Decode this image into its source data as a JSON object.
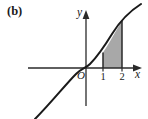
{
  "figure": {
    "panel_label": "(b)",
    "background_color": "#ffffff",
    "ink_color": "#1a1a1a",
    "shade_color": "#a8a8a8",
    "axes": {
      "x_axis_label": "x",
      "y_axis_label": "y",
      "origin_label": "O",
      "x_tick_labels": [
        "1",
        "2"
      ],
      "y_tick_labels": [],
      "x_arrow": "arrow-right",
      "y_arrow": "arrow-up"
    },
    "curve": {
      "description": "increasing cubic-like curve through the origin",
      "path": "M 35 119 C 50 104, 66 84, 76 74 C 82 68, 86 68, 90 64 C 98 56, 104 47, 112 34 C 120 21, 130 11, 141 4"
    },
    "shaded_region": {
      "label": "area under curve between x = 1 and x = 2",
      "x_from": "1",
      "x_to": "2",
      "path": "M 103 68 L 103 52.6 C 107 46.4, 110 41.5, 113.5 35.2 C 117 29.1, 119.5 24.6, 122 20.4 L 122 68 Z"
    },
    "boundary_lines": [
      {
        "name": "vertical-line-x1",
        "x": "1"
      },
      {
        "name": "vertical-line-x2",
        "x": "2"
      }
    ]
  }
}
